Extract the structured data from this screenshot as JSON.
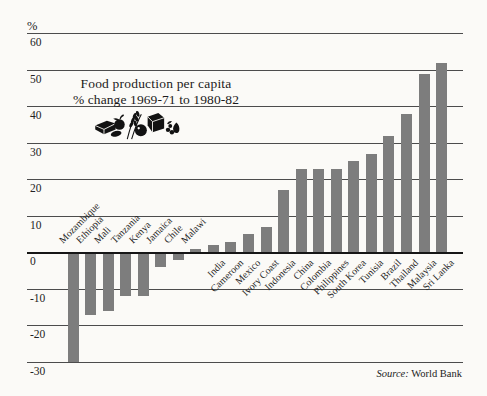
{
  "unit": {
    "label": "%"
  },
  "source": {
    "prefix": "Source:",
    "text": "World Bank"
  },
  "illustration": {
    "name": "food-cluster-icon"
  },
  "colors": {
    "bar": "#7d7d7d",
    "grid_line": "#4c4c4c",
    "axis_line": "#161616",
    "text": "#1f1f1f",
    "background": "#fbfaf7"
  },
  "chart_data": {
    "type": "bar",
    "title": "Food production per capita",
    "subtitle": "% change 1969-71 to 1980-82",
    "ylabel": "%",
    "ylim": [
      -30,
      60
    ],
    "grid": true,
    "legend": "none",
    "yticks": [
      60,
      50,
      40,
      30,
      20,
      10,
      0,
      -10,
      -20,
      -30
    ],
    "categories": [
      "Mozambique",
      "Ethiopia",
      "Mali",
      "Tanzania",
      "Kenya",
      "Jamaica",
      "Chile",
      "Malawi",
      "India",
      "Cameroon",
      "Mexico",
      "Ivory Coast",
      "Indonesia",
      "China",
      "Colombia",
      "Philippines",
      "South Korea",
      "Tunisia",
      "Brazil",
      "Thailand",
      "Malaysia",
      "Sri Lanka"
    ],
    "values": [
      -30,
      -17,
      -16,
      -12,
      -12,
      -4,
      -2,
      1,
      2,
      3,
      5,
      7,
      17,
      23,
      23,
      23,
      25,
      27,
      32,
      38,
      49,
      52
    ],
    "label_position": [
      "above",
      "above",
      "above",
      "above",
      "above",
      "above",
      "above",
      "above",
      "below",
      "below",
      "below",
      "below",
      "below",
      "below",
      "below",
      "below",
      "below",
      "below",
      "below",
      "below",
      "below",
      "below"
    ],
    "source": "Source: World Bank"
  }
}
